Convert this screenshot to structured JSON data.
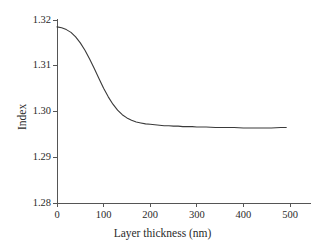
{
  "chart_data": {
    "type": "line",
    "title": "",
    "subtitle": "",
    "xlabel": "Layer thickness (nm)",
    "ylabel": "Index",
    "xlim": [
      0,
      500
    ],
    "ylim": [
      1.28,
      1.32
    ],
    "xticks": [
      0,
      100,
      200,
      300,
      400,
      500
    ],
    "yticks": [
      1.28,
      1.29,
      1.3,
      1.31,
      1.32
    ],
    "xtick_labels": [
      "0",
      "100",
      "200",
      "300",
      "400",
      "500"
    ],
    "ytick_labels": [
      "1.28",
      "1.29",
      "1.30",
      "1.31",
      "1.32"
    ],
    "grid": false,
    "legend": null,
    "legend_position": "none",
    "line_color": "#3a3a3a",
    "line_width": 1.1,
    "axis_color": "#555555",
    "background_color": "#ffffff",
    "series": [
      {
        "name": "Index",
        "x": [
          0,
          10,
          20,
          30,
          40,
          50,
          60,
          70,
          80,
          90,
          100,
          110,
          120,
          130,
          140,
          150,
          160,
          170,
          180,
          190,
          200,
          210,
          220,
          230,
          240,
          250,
          260,
          270,
          280,
          290,
          300,
          320,
          340,
          360,
          380,
          400,
          420,
          440,
          460,
          480,
          492
        ],
        "y": [
          1.3185,
          1.3183,
          1.3179,
          1.3173,
          1.3163,
          1.315,
          1.3134,
          1.3115,
          1.3094,
          1.3072,
          1.3051,
          1.3032,
          1.3016,
          1.3003,
          1.2993,
          1.2986,
          1.2981,
          1.2977,
          1.2975,
          1.2973,
          1.2972,
          1.2971,
          1.297,
          1.2969,
          1.2969,
          1.2968,
          1.2968,
          1.2967,
          1.2967,
          1.2967,
          1.2966,
          1.2966,
          1.2965,
          1.2965,
          1.2965,
          1.2964,
          1.2964,
          1.2964,
          1.2964,
          1.2965,
          1.2965
        ]
      }
    ]
  },
  "axes": {
    "x_title": "Layer thickness (nm)",
    "y_title": "Index"
  }
}
